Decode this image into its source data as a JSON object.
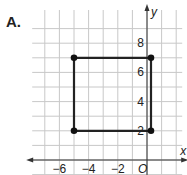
{
  "chart_data": {
    "type": "scatter",
    "label": "A.",
    "xlabel": "x",
    "ylabel": "y",
    "origin_label": "O",
    "xlim": [
      -8,
      2
    ],
    "ylim": [
      -1,
      10
    ],
    "grid": true,
    "x_ticks": [
      {
        "value": -6,
        "label": "−6"
      },
      {
        "value": -4,
        "label": "−4"
      },
      {
        "value": -2,
        "label": "−2"
      }
    ],
    "y_ticks": [
      {
        "value": 2,
        "label": "2"
      },
      {
        "value": 4,
        "label": "4"
      },
      {
        "value": 6,
        "label": "6"
      },
      {
        "value": 8,
        "label": "8"
      }
    ],
    "points": [
      {
        "x": -5,
        "y": 7
      },
      {
        "x": 0,
        "y": 7
      },
      {
        "x": 0,
        "y": 2
      },
      {
        "x": -5,
        "y": 2
      }
    ],
    "polygon": "closed"
  }
}
